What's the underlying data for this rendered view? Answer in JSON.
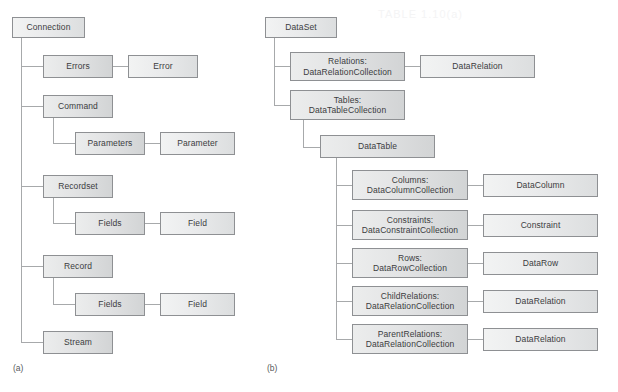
{
  "diagram": {
    "width": 618,
    "height": 392,
    "background": "#ffffff",
    "box_border_color": "#8e9093",
    "box_fill_light": "#f2f3f3",
    "box_fill_dark": "#d2d4d5",
    "line_color": "#a7a9ab",
    "text_color": "#3b3c3e"
  },
  "panel_a": {
    "caption": "(a)",
    "root": "Connection",
    "nodes": {
      "connection": "Connection",
      "errors": "Errors",
      "error": "Error",
      "command": "Command",
      "parameters": "Parameters",
      "parameter": "Parameter",
      "recordset": "Recordset",
      "recordset_fields": "Fields",
      "recordset_field": "Field",
      "record": "Record",
      "record_fields": "Fields",
      "record_field": "Field",
      "stream": "Stream"
    }
  },
  "panel_b": {
    "caption": "(b)",
    "root": "DataSet",
    "nodes": {
      "dataset": "DataSet",
      "relations": "Relations:\nDataRelationCollection",
      "datarelation_top": "DataRelation",
      "tables": "Tables:\nDataTableCollection",
      "datatable": "DataTable",
      "columns": "Columns:\nDataColumnCollection",
      "datacolumn": "DataColumn",
      "constraints": "Constraints:\nDataConstraintCollection",
      "constraint": "Constraint",
      "rows": "Rows:\nDataRowCollection",
      "datarow": "DataRow",
      "childrelations": "ChildRelations:\nDataRelationCollection",
      "datarelation_child": "DataRelation",
      "parentrelations": "ParentRelations:\nDataRelationCollection",
      "datarelation_parent": "DataRelation"
    }
  }
}
